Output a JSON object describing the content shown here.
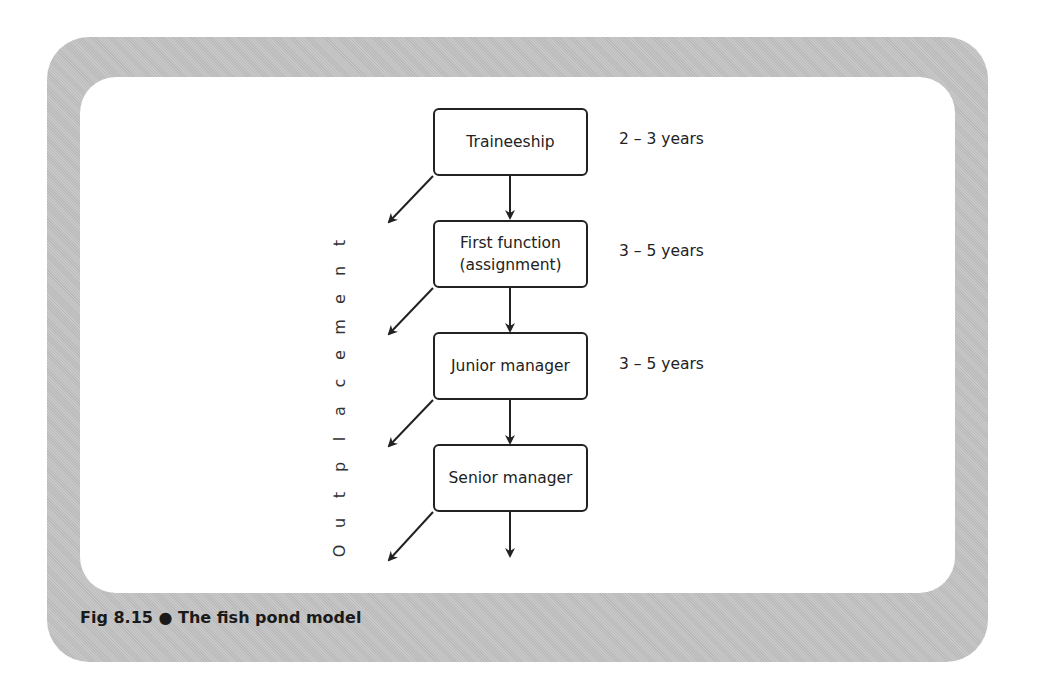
{
  "figure": {
    "caption": "Fig 8.15 ● The fish pond model",
    "side_label": "Outplacement",
    "stages": [
      {
        "label": "Traineeship",
        "duration": "2 – 3 years"
      },
      {
        "label": "First function\n(assignment)",
        "label_line1": "First function",
        "label_line2": "(assignment)",
        "duration": "3 – 5 years"
      },
      {
        "label": "Junior manager",
        "duration": "3 – 5 years"
      },
      {
        "label": "Senior manager",
        "duration": ""
      }
    ],
    "colors": {
      "frame": "#c2c2c2",
      "stroke": "#222222",
      "background": "#ffffff"
    }
  }
}
